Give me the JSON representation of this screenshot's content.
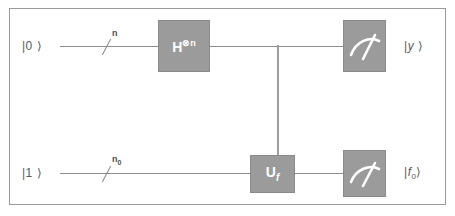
{
  "figure": {
    "background_color": "#ffffff",
    "frame_border_color": "#9a9a9a",
    "wire_color": "#8d8d8d",
    "gate_fill_color": "#9b9b9b",
    "gate_border_color": "#8a8a8a",
    "gate_text_color": "#ffffff",
    "label_text_color": "#5a5a5a"
  },
  "wires": [
    {
      "name": "top-register",
      "input_ket": "|0 ⟩",
      "register_width_label": "n",
      "register_width_sub": "",
      "output_ket_prefix": "|",
      "output_ket_symbol": "y",
      "output_ket_sub": "",
      "output_ket_suffix": " ⟩"
    },
    {
      "name": "bottom-register",
      "input_ket": "|1 ⟩",
      "register_width_label": "n",
      "register_width_sub": "0",
      "output_ket_prefix": "|",
      "output_ket_symbol": "f",
      "output_ket_sub": "0",
      "output_ket_suffix": "⟩"
    }
  ],
  "gates": [
    {
      "name": "hadamard-gate",
      "symbol": "H",
      "superscript": "⊗n",
      "subscript": "",
      "on_wire": "top-register",
      "description": "Hadamard applied to n qubits"
    },
    {
      "name": "oracle-gate",
      "symbol": "U",
      "superscript": "",
      "subscript": "f",
      "on_wire": "bottom-register",
      "description": "Oracle unitary for function f, controlled from the top register"
    }
  ],
  "measurements": [
    {
      "name": "measure-top",
      "icon": "meter-icon",
      "on_wire": "top-register",
      "result_label": "|y ⟩"
    },
    {
      "name": "measure-bottom",
      "icon": "meter-icon",
      "on_wire": "bottom-register",
      "result_label": "|f0⟩"
    }
  ]
}
